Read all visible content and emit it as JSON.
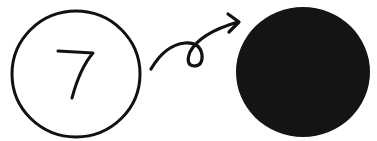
{
  "diagram": {
    "left_node": {
      "label": "7",
      "fill": "#ffffff",
      "stroke": "#111111"
    },
    "arrow": {
      "style": "looped-curve",
      "direction": "left-to-right",
      "color": "#111111"
    },
    "right_node": {
      "label": "",
      "fill": "#141414"
    }
  }
}
